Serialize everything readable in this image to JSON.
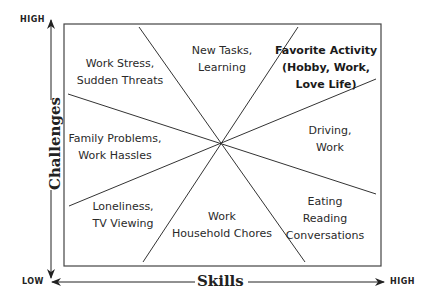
{
  "diagram": {
    "x_axis": {
      "title": "Skills",
      "low": "LOW",
      "high": "HIGH"
    },
    "y_axis": {
      "title": "Challenges",
      "low": "LOW",
      "high": "HIGH"
    },
    "regions": [
      {
        "id": "work-stress",
        "lines": [
          "Work Stress,",
          "Sudden Threats"
        ],
        "bold": false
      },
      {
        "id": "new-tasks",
        "lines": [
          "New Tasks,",
          "Learning"
        ],
        "bold": false
      },
      {
        "id": "favorite-activity",
        "lines": [
          "Favorite Activity",
          "(Hobby, Work,",
          "Love Life)"
        ],
        "bold": true
      },
      {
        "id": "driving",
        "lines": [
          "Driving,",
          "Work"
        ],
        "bold": false
      },
      {
        "id": "eating",
        "lines": [
          "Eating",
          "Reading",
          "Conversations"
        ],
        "bold": false
      },
      {
        "id": "household",
        "lines": [
          "Work",
          "Household Chores"
        ],
        "bold": false
      },
      {
        "id": "loneliness",
        "lines": [
          "Loneliness,",
          "TV Viewing"
        ],
        "bold": false
      },
      {
        "id": "family-problems",
        "lines": [
          "Family Problems,",
          "Work Hassles"
        ],
        "bold": false
      }
    ],
    "colors": {
      "line": "#333333",
      "text": "#2a2a2a",
      "background": "#ffffff"
    }
  }
}
